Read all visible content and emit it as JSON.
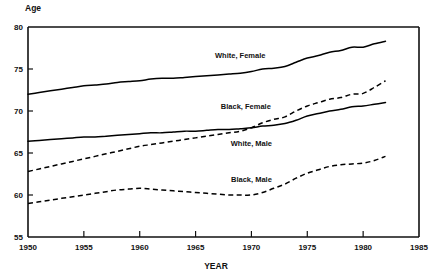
{
  "chart_data": {
    "type": "line",
    "title": "",
    "xlabel": "YEAR",
    "ylabel": "Age",
    "xlim": [
      1950,
      1985
    ],
    "ylim": [
      55,
      80
    ],
    "xticks": [
      1950,
      1955,
      1960,
      1965,
      1970,
      1975,
      1980,
      1985
    ],
    "yticks": [
      55,
      60,
      65,
      70,
      75,
      80
    ],
    "xtick_labels": [
      "1950",
      "1955",
      "1960",
      "1965",
      "1970",
      "1975",
      "1980",
      "1985"
    ],
    "ytick_labels": [
      "55",
      "60",
      "65",
      "70",
      "75",
      "80"
    ],
    "grid": false,
    "legend": "inline-annotations",
    "x": [
      1950,
      1951,
      1952,
      1953,
      1954,
      1955,
      1956,
      1957,
      1958,
      1959,
      1960,
      1961,
      1962,
      1963,
      1964,
      1965,
      1966,
      1967,
      1968,
      1969,
      1970,
      1971,
      1972,
      1973,
      1974,
      1975,
      1976,
      1977,
      1978,
      1979,
      1980,
      1981,
      1982
    ],
    "series": [
      {
        "name": "White, Female",
        "style": "solid",
        "values": [
          72.0,
          72.2,
          72.4,
          72.6,
          72.8,
          73.0,
          73.1,
          73.2,
          73.4,
          73.5,
          73.6,
          73.8,
          73.9,
          73.9,
          74.0,
          74.1,
          74.2,
          74.3,
          74.4,
          74.5,
          74.7,
          75.0,
          75.1,
          75.3,
          75.8,
          76.3,
          76.6,
          77.0,
          77.2,
          77.6,
          77.6,
          78.0,
          78.3
        ]
      },
      {
        "name": "Black, Female",
        "style": "dashed",
        "values": [
          62.8,
          63.1,
          63.4,
          63.7,
          64.0,
          64.3,
          64.6,
          64.9,
          65.2,
          65.5,
          65.8,
          66.0,
          66.2,
          66.4,
          66.6,
          66.8,
          67.0,
          67.2,
          67.4,
          67.6,
          68.0,
          68.6,
          69.0,
          69.3,
          70.0,
          70.6,
          71.0,
          71.4,
          71.6,
          72.0,
          72.1,
          72.8,
          73.6
        ]
      },
      {
        "name": "White, Male",
        "style": "solid",
        "values": [
          66.4,
          66.5,
          66.6,
          66.7,
          66.8,
          66.9,
          66.9,
          67.0,
          67.1,
          67.2,
          67.3,
          67.4,
          67.4,
          67.5,
          67.6,
          67.6,
          67.7,
          67.8,
          67.8,
          67.9,
          68.0,
          68.2,
          68.3,
          68.5,
          68.9,
          69.4,
          69.7,
          70.0,
          70.2,
          70.5,
          70.6,
          70.8,
          71.0
        ]
      },
      {
        "name": "Black, Male",
        "style": "dashed",
        "values": [
          59.0,
          59.2,
          59.4,
          59.6,
          59.8,
          60.0,
          60.2,
          60.4,
          60.6,
          60.7,
          60.8,
          60.7,
          60.6,
          60.5,
          60.4,
          60.3,
          60.2,
          60.1,
          60.0,
          60.0,
          60.0,
          60.3,
          60.8,
          61.3,
          62.0,
          62.6,
          63.0,
          63.4,
          63.6,
          63.7,
          63.8,
          64.1,
          64.6
        ]
      }
    ],
    "annotations": [
      {
        "text": "White, Female",
        "x": 1969.0,
        "y": 76.3
      },
      {
        "text": "Black, Female",
        "x": 1969.5,
        "y": 70.2
      },
      {
        "text": "White, Male",
        "x": 1970.0,
        "y": 65.8
      },
      {
        "text": "Black, Male",
        "x": 1970.0,
        "y": 61.5
      }
    ],
    "colors": {
      "line": "#000000",
      "axis": "#111111",
      "background": "#ffffff"
    }
  }
}
